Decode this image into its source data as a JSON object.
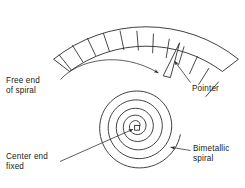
{
  "diagram": {
    "stroke_color": "#2b2b2b",
    "background_color": "#ffffff",
    "labels": {
      "free_end": "Free end\nof spiral",
      "pointer": "Pointer",
      "center_end": "Center end\nfixed",
      "bimetallic": "Bimetallic\nspiral"
    },
    "scale": {
      "name": "curved-scale-band",
      "tick_count": 12,
      "arc_span_degrees": 104,
      "center": {
        "x": 146,
        "y": 172
      },
      "inner_radius": 128,
      "outer_radius": 148
    },
    "spiral": {
      "name": "bimetallic-spiral",
      "turns": 3,
      "center": {
        "x": 137,
        "y": 128
      },
      "outer_radius": 58,
      "hub_size": 5
    },
    "pointer": {
      "name": "pointer-needle",
      "tip": {
        "x": 179,
        "y": 43
      },
      "base": {
        "x": 166,
        "y": 77
      }
    },
    "leaders": [
      {
        "name": "leader-free-end",
        "from": {
          "x": 62,
          "y": 78
        },
        "to": {
          "x": 160,
          "y": 74
        },
        "arrow": true
      },
      {
        "name": "leader-pointer",
        "from": {
          "x": 190,
          "y": 82
        },
        "to": {
          "x": 174,
          "y": 60
        },
        "arrow": true
      },
      {
        "name": "leader-center-end",
        "from": {
          "x": 62,
          "y": 161
        },
        "to": {
          "x": 134,
          "y": 129
        },
        "arrow": true
      },
      {
        "name": "leader-bimetallic",
        "from": {
          "x": 190,
          "y": 150
        },
        "to": {
          "x": 170,
          "y": 147
        },
        "arrow": true
      }
    ]
  }
}
